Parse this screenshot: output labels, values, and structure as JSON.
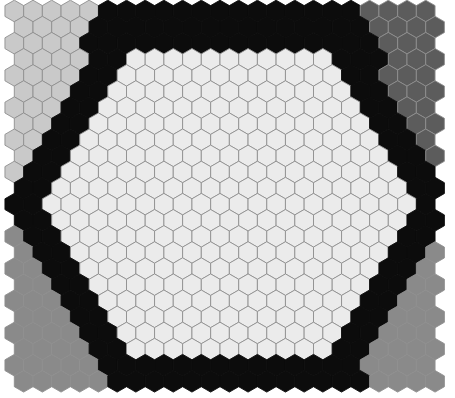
{
  "board": {
    "width": 455,
    "height": 398,
    "rows": 24,
    "cols": 23,
    "hex_width": 18.7,
    "row_step": 16.1,
    "origin_x": 14.3,
    "origin_y": 11,
    "stroke_color": "#8f8f8f",
    "stroke_width": 0.9
  },
  "colors": {
    "center": "#ebebeb",
    "border": "#0c0c0c",
    "top_left": "#c9c9c9",
    "top_right": "#5c5c5c",
    "bottom": "#8a8a8a"
  },
  "regions": {
    "inner_hexagon": {
      "top": 45,
      "bottom": 350,
      "top_left_x": 130,
      "top_right_x": 330,
      "left_x": 42,
      "right_x": 418,
      "mid_y": 198
    },
    "outer_hexagon": {
      "top": -5,
      "bottom": 403,
      "top_left_x": 112,
      "top_right_x": 350,
      "left_x": 8,
      "right_x": 450,
      "mid_y": 205
    },
    "split_y_left": 212,
    "split_y_right": 208
  }
}
